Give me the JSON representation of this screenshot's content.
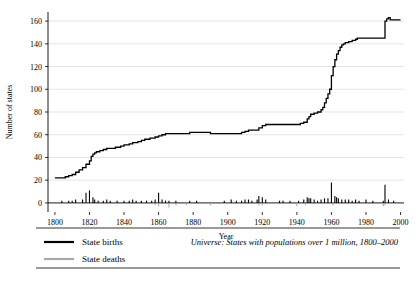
{
  "chart_data": {
    "type": "line",
    "title": "",
    "xlabel": "Year",
    "ylabel": "Number of states",
    "xlim": [
      1796,
      2002
    ],
    "ylim": [
      -8,
      168
    ],
    "xticks": [
      1800,
      1820,
      1840,
      1860,
      1880,
      1900,
      1920,
      1940,
      1960,
      1980,
      2000
    ],
    "yticks": [
      0,
      20,
      40,
      60,
      80,
      100,
      120,
      140,
      160
    ],
    "grid": "horizontal",
    "legend_position": "bottom-left",
    "series": [
      {
        "name": "State births",
        "color": "#000000",
        "kind": "cumulative-line-plus-spikes",
        "points": [
          [
            1800,
            22
          ],
          [
            1805,
            22
          ],
          [
            1806,
            23
          ],
          [
            1808,
            24
          ],
          [
            1810,
            25
          ],
          [
            1812,
            27
          ],
          [
            1814,
            29
          ],
          [
            1816,
            31
          ],
          [
            1818,
            34
          ],
          [
            1820,
            37
          ],
          [
            1821,
            41
          ],
          [
            1822,
            43
          ],
          [
            1823,
            44
          ],
          [
            1824,
            45
          ],
          [
            1826,
            46
          ],
          [
            1828,
            47
          ],
          [
            1830,
            48
          ],
          [
            1832,
            48
          ],
          [
            1835,
            49
          ],
          [
            1838,
            50
          ],
          [
            1840,
            51
          ],
          [
            1843,
            52
          ],
          [
            1845,
            53
          ],
          [
            1848,
            54
          ],
          [
            1850,
            55
          ],
          [
            1852,
            56
          ],
          [
            1855,
            57
          ],
          [
            1858,
            58
          ],
          [
            1860,
            59
          ],
          [
            1862,
            60
          ],
          [
            1864,
            61
          ],
          [
            1866,
            61
          ],
          [
            1870,
            61
          ],
          [
            1875,
            61
          ],
          [
            1878,
            62
          ],
          [
            1880,
            62
          ],
          [
            1885,
            62
          ],
          [
            1890,
            61
          ],
          [
            1895,
            61
          ],
          [
            1900,
            61
          ],
          [
            1905,
            61
          ],
          [
            1908,
            62
          ],
          [
            1910,
            63
          ],
          [
            1912,
            64
          ],
          [
            1914,
            64
          ],
          [
            1915,
            64
          ],
          [
            1918,
            66
          ],
          [
            1920,
            68
          ],
          [
            1922,
            69
          ],
          [
            1925,
            69
          ],
          [
            1930,
            69
          ],
          [
            1935,
            69
          ],
          [
            1938,
            69
          ],
          [
            1940,
            69
          ],
          [
            1942,
            70
          ],
          [
            1944,
            71
          ],
          [
            1946,
            74
          ],
          [
            1947,
            76
          ],
          [
            1948,
            78
          ],
          [
            1950,
            79
          ],
          [
            1952,
            80
          ],
          [
            1954,
            82
          ],
          [
            1955,
            84
          ],
          [
            1956,
            88
          ],
          [
            1957,
            92
          ],
          [
            1958,
            96
          ],
          [
            1959,
            100
          ],
          [
            1960,
            112
          ],
          [
            1961,
            120
          ],
          [
            1962,
            126
          ],
          [
            1963,
            131
          ],
          [
            1964,
            134
          ],
          [
            1965,
            137
          ],
          [
            1966,
            139
          ],
          [
            1967,
            140
          ],
          [
            1968,
            141
          ],
          [
            1970,
            142
          ],
          [
            1972,
            143
          ],
          [
            1974,
            144
          ],
          [
            1975,
            145
          ],
          [
            1976,
            145
          ],
          [
            1978,
            145
          ],
          [
            1980,
            145
          ],
          [
            1985,
            145
          ],
          [
            1988,
            145
          ],
          [
            1990,
            145
          ],
          [
            1991,
            160
          ],
          [
            1992,
            162
          ],
          [
            1993,
            163
          ],
          [
            1994,
            161
          ],
          [
            1996,
            161
          ],
          [
            1998,
            161
          ],
          [
            2000,
            161
          ]
        ],
        "spikes": [
          [
            1804,
            2
          ],
          [
            1808,
            2
          ],
          [
            1810,
            2
          ],
          [
            1812,
            3
          ],
          [
            1816,
            3
          ],
          [
            1818,
            9
          ],
          [
            1820,
            11
          ],
          [
            1822,
            5
          ],
          [
            1823,
            3
          ],
          [
            1825,
            2
          ],
          [
            1828,
            2
          ],
          [
            1830,
            3
          ],
          [
            1832,
            2
          ],
          [
            1836,
            2
          ],
          [
            1840,
            2
          ],
          [
            1843,
            2
          ],
          [
            1845,
            3
          ],
          [
            1847,
            2
          ],
          [
            1850,
            2
          ],
          [
            1853,
            2
          ],
          [
            1856,
            2
          ],
          [
            1858,
            3
          ],
          [
            1860,
            9
          ],
          [
            1862,
            3
          ],
          [
            1864,
            2
          ],
          [
            1866,
            2
          ],
          [
            1870,
            2
          ],
          [
            1878,
            2
          ],
          [
            1882,
            2
          ],
          [
            1898,
            2
          ],
          [
            1902,
            3
          ],
          [
            1905,
            2
          ],
          [
            1908,
            2
          ],
          [
            1910,
            3
          ],
          [
            1912,
            3
          ],
          [
            1914,
            2
          ],
          [
            1917,
            3
          ],
          [
            1918,
            6
          ],
          [
            1920,
            5
          ],
          [
            1922,
            3
          ],
          [
            1930,
            2
          ],
          [
            1932,
            2
          ],
          [
            1936,
            2
          ],
          [
            1941,
            2
          ],
          [
            1944,
            3
          ],
          [
            1946,
            5
          ],
          [
            1947,
            4
          ],
          [
            1948,
            4
          ],
          [
            1950,
            3
          ],
          [
            1952,
            2
          ],
          [
            1954,
            3
          ],
          [
            1956,
            4
          ],
          [
            1958,
            4
          ],
          [
            1960,
            18
          ],
          [
            1962,
            6
          ],
          [
            1963,
            5
          ],
          [
            1964,
            4
          ],
          [
            1966,
            3
          ],
          [
            1968,
            3
          ],
          [
            1970,
            3
          ],
          [
            1972,
            2
          ],
          [
            1974,
            3
          ],
          [
            1976,
            2
          ],
          [
            1980,
            3
          ],
          [
            1984,
            2
          ],
          [
            1990,
            2
          ],
          [
            1991,
            16
          ],
          [
            1993,
            3
          ],
          [
            1996,
            2
          ]
        ]
      },
      {
        "name": "State deaths",
        "color": "#a8a8a8",
        "kind": "spikes-below-axis",
        "spikes": [
          [
            1806,
            -1
          ],
          [
            1810,
            -1
          ],
          [
            1822,
            -1
          ],
          [
            1840,
            -1
          ],
          [
            1848,
            -1
          ],
          [
            1858,
            -2
          ],
          [
            1860,
            -3
          ],
          [
            1866,
            -4
          ],
          [
            1870,
            -2
          ],
          [
            1876,
            -2
          ],
          [
            1890,
            -2
          ],
          [
            1900,
            -1
          ],
          [
            1918,
            -2
          ],
          [
            1920,
            -2
          ],
          [
            1940,
            -3
          ],
          [
            1945,
            -2
          ],
          [
            1958,
            -1
          ],
          [
            1961,
            -2
          ],
          [
            1963,
            -1
          ],
          [
            1975,
            -1
          ],
          [
            1990,
            -3
          ],
          [
            1991,
            -2
          ]
        ]
      }
    ],
    "legend": [
      {
        "label": "State births",
        "color": "#000000"
      },
      {
        "label": "State deaths",
        "color": "#a8a8a8"
      }
    ],
    "note": "Universe: States with populations over 1 million, 1800–2000"
  }
}
